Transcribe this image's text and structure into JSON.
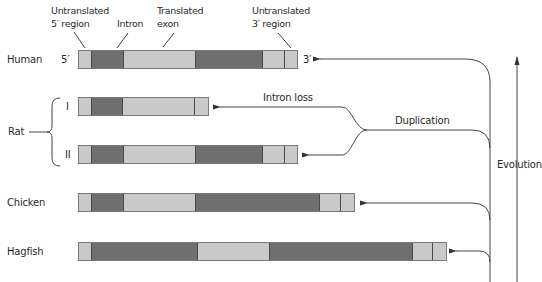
{
  "header_labels": {
    "utr5": [
      "Untranslated",
      "5′ region"
    ],
    "intron": "Intron",
    "exon": [
      "Translated",
      "exon"
    ],
    "utr3": [
      "Untranslated",
      "3′ region"
    ]
  },
  "end_labels": {
    "five_prime": "5′",
    "three_prime": "3′"
  },
  "species": {
    "human": "Human",
    "rat": "Rat",
    "rat_i": "I",
    "rat_ii": "II",
    "chicken": "Chicken",
    "hagfish": "Hagfish"
  },
  "annotations": {
    "intron_loss": "Intron loss",
    "duplication": "Duplication",
    "evolution": "Evolution"
  },
  "colors": {
    "utr": "#c9c9c9",
    "exon": "#c9c9c9",
    "intron": "#6f6f6f",
    "line": "#444444"
  },
  "genes": [
    {
      "name": "human",
      "segments": [
        {
          "type": "utr5",
          "from": 78,
          "to": 91
        },
        {
          "type": "intron",
          "from": 91,
          "to": 123
        },
        {
          "type": "exon",
          "from": 123,
          "to": 196
        },
        {
          "type": "intron",
          "from": 196,
          "to": 264
        },
        {
          "type": "exon",
          "from": 264,
          "to": 286
        },
        {
          "type": "utr3",
          "from": 286,
          "to": 298
        }
      ]
    },
    {
      "name": "rat_i",
      "segments": [
        {
          "type": "utr5",
          "from": 78,
          "to": 91
        },
        {
          "type": "intron",
          "from": 91,
          "to": 123
        },
        {
          "type": "exon",
          "from": 123,
          "to": 196
        },
        {
          "type": "utr3",
          "from": 196,
          "to": 209
        }
      ]
    },
    {
      "name": "rat_ii",
      "segments": [
        {
          "type": "utr5",
          "from": 78,
          "to": 91
        },
        {
          "type": "intron",
          "from": 91,
          "to": 123
        },
        {
          "type": "exon",
          "from": 123,
          "to": 196
        },
        {
          "type": "intron",
          "from": 196,
          "to": 264
        },
        {
          "type": "exon",
          "from": 264,
          "to": 286
        },
        {
          "type": "utr3",
          "from": 286,
          "to": 298
        }
      ]
    },
    {
      "name": "chicken",
      "segments": [
        {
          "type": "utr5",
          "from": 78,
          "to": 91
        },
        {
          "type": "intron",
          "from": 91,
          "to": 123
        },
        {
          "type": "exon",
          "from": 123,
          "to": 196
        },
        {
          "type": "intron",
          "from": 196,
          "to": 321
        },
        {
          "type": "exon",
          "from": 321,
          "to": 342
        },
        {
          "type": "utr3",
          "from": 342,
          "to": 355
        }
      ]
    },
    {
      "name": "hagfish",
      "segments": [
        {
          "type": "utr5",
          "from": 78,
          "to": 91
        },
        {
          "type": "intron",
          "from": 91,
          "to": 198
        },
        {
          "type": "exon",
          "from": 198,
          "to": 270
        },
        {
          "type": "intron",
          "from": 270,
          "to": 414
        },
        {
          "type": "exon",
          "from": 414,
          "to": 434
        },
        {
          "type": "utr3",
          "from": 434,
          "to": 447
        }
      ]
    }
  ]
}
